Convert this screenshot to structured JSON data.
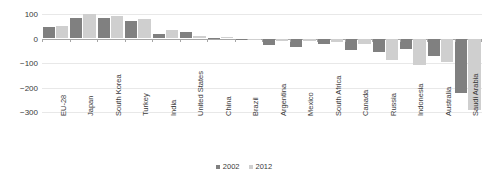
{
  "chart_data": {
    "type": "bar",
    "title": "",
    "subtitle": "",
    "xlabel": "",
    "ylabel": "",
    "ylim": [
      -300,
      100
    ],
    "yticks": [
      100,
      0,
      -100,
      -200,
      -300
    ],
    "ytick_labels": [
      "100",
      "0",
      "−100",
      "−200",
      "−300"
    ],
    "grid": true,
    "legend_position": "bottom-center",
    "categories": [
      "EU-28",
      "Japan",
      "South Korea",
      "Turkey",
      "India",
      "United States",
      "China",
      "Brazil",
      "Argentina",
      "Mexico",
      "South Africa",
      "Canada",
      "Russia",
      "Indonesia",
      "Australia",
      "Saudi Arabia"
    ],
    "series": [
      {
        "name": "2002",
        "color": "#808080",
        "values": [
          45,
          85,
          85,
          72,
          18,
          28,
          4,
          -6,
          -28,
          -33,
          -22,
          -47,
          -56,
          -44,
          -72,
          -222
        ]
      },
      {
        "name": "2012",
        "color": "#cfcfcf",
        "values": [
          52,
          98,
          92,
          80,
          34,
          12,
          8,
          -3,
          -10,
          -12,
          -14,
          -22,
          -88,
          -108,
          -95,
          -290
        ]
      }
    ]
  },
  "legend": {
    "items": [
      {
        "label": "2002",
        "color": "#808080"
      },
      {
        "label": "2012",
        "color": "#cfcfcf"
      }
    ]
  }
}
